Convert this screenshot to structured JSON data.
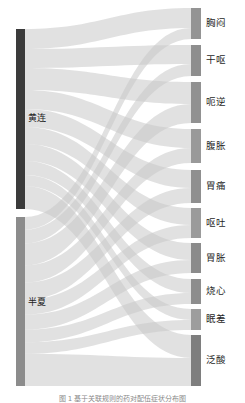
{
  "figure": {
    "caption": "图 1  基于关联规则的药对配伍症状分布图",
    "background": "#ffffff"
  },
  "chart_data": {
    "type": "sankey",
    "title": "",
    "xlabel": "",
    "ylabel": "",
    "orientation": "horizontal",
    "link_color": "#c9c9c9",
    "link_opacity": 0.55,
    "nodes": [
      {
        "id": "huanglian",
        "label": "黄连",
        "side": "left",
        "color": "#3b3b3b",
        "x": 16,
        "y": 29,
        "width": 9,
        "height": 180,
        "value": 180
      },
      {
        "id": "banxia",
        "label": "半夏",
        "side": "left",
        "color": "#8c8c8c",
        "x": 16,
        "y": 217,
        "width": 9,
        "height": 169,
        "value": 169
      },
      {
        "id": "xiongmen",
        "label": "胸闷",
        "side": "right",
        "color": "#949494",
        "x": 191,
        "y": 8,
        "width": 10,
        "height": 31,
        "value": 31
      },
      {
        "id": "gan_ou",
        "label": "干呕",
        "side": "right",
        "color": "#8e8e8e",
        "x": 191,
        "y": 45,
        "width": 10,
        "height": 31,
        "value": 31
      },
      {
        "id": "e_ni",
        "label": "呃逆",
        "side": "right",
        "color": "#919191",
        "x": 191,
        "y": 82,
        "width": 10,
        "height": 41,
        "value": 41
      },
      {
        "id": "fuzhang",
        "label": "腹胀",
        "side": "right",
        "color": "#999999",
        "x": 191,
        "y": 129,
        "width": 10,
        "height": 34,
        "value": 34
      },
      {
        "id": "weitong",
        "label": "胃痛",
        "side": "right",
        "color": "#8f8f8f",
        "x": 191,
        "y": 170,
        "width": 10,
        "height": 33,
        "value": 33
      },
      {
        "id": "outu",
        "label": "呕吐",
        "side": "right",
        "color": "#9b9b9b",
        "x": 191,
        "y": 208,
        "width": 10,
        "height": 30,
        "value": 30
      },
      {
        "id": "weizhang",
        "label": "胃胀",
        "side": "right",
        "color": "#8b8b8b",
        "x": 191,
        "y": 243,
        "width": 10,
        "height": 30,
        "value": 30
      },
      {
        "id": "shaoxin",
        "label": "烧心",
        "side": "right",
        "color": "#8d8d8d",
        "x": 191,
        "y": 279,
        "width": 10,
        "height": 25,
        "value": 25
      },
      {
        "id": "mianchai",
        "label": "眠差",
        "side": "right",
        "color": "#9d9d9d",
        "x": 191,
        "y": 309,
        "width": 10,
        "height": 21,
        "value": 21
      },
      {
        "id": "fansuan",
        "label": "泛酸",
        "side": "right",
        "color": "#7e7e7e",
        "x": 191,
        "y": 335,
        "width": 10,
        "height": 51,
        "value": 51
      }
    ],
    "links": [
      {
        "source": "huanglian",
        "target": "xiongmen",
        "value": 20
      },
      {
        "source": "huanglian",
        "target": "gan_ou",
        "value": 19
      },
      {
        "source": "huanglian",
        "target": "e_ni",
        "value": 22
      },
      {
        "source": "huanglian",
        "target": "fuzhang",
        "value": 19
      },
      {
        "source": "huanglian",
        "target": "weitong",
        "value": 18
      },
      {
        "source": "huanglian",
        "target": "outu",
        "value": 17
      },
      {
        "source": "huanglian",
        "target": "weizhang",
        "value": 17
      },
      {
        "source": "huanglian",
        "target": "shaoxin",
        "value": 14
      },
      {
        "source": "huanglian",
        "target": "mianchai",
        "value": 11
      },
      {
        "source": "huanglian",
        "target": "fansuan",
        "value": 23
      },
      {
        "source": "banxia",
        "target": "xiongmen",
        "value": 11
      },
      {
        "source": "banxia",
        "target": "gan_ou",
        "value": 12
      },
      {
        "source": "banxia",
        "target": "e_ni",
        "value": 19
      },
      {
        "source": "banxia",
        "target": "fuzhang",
        "value": 15
      },
      {
        "source": "banxia",
        "target": "weitong",
        "value": 15
      },
      {
        "source": "banxia",
        "target": "outu",
        "value": 13
      },
      {
        "source": "banxia",
        "target": "weizhang",
        "value": 13
      },
      {
        "source": "banxia",
        "target": "shaoxin",
        "value": 11
      },
      {
        "source": "banxia",
        "target": "mianchai",
        "value": 10
      },
      {
        "source": "banxia",
        "target": "fansuan",
        "value": 28
      }
    ]
  },
  "labels": {
    "sources": [
      {
        "text": "黄连",
        "x": 28,
        "y": 114
      },
      {
        "text": "半夏",
        "x": 28,
        "y": 298
      }
    ],
    "targets": [
      {
        "text": "胸闷",
        "x": 206,
        "y": 18
      },
      {
        "text": "干呕",
        "x": 206,
        "y": 55
      },
      {
        "text": "呃逆",
        "x": 206,
        "y": 97
      },
      {
        "text": "腹胀",
        "x": 206,
        "y": 141
      },
      {
        "text": "胃痛",
        "x": 206,
        "y": 181
      },
      {
        "text": "呕吐",
        "x": 206,
        "y": 218
      },
      {
        "text": "胃胀",
        "x": 206,
        "y": 253
      },
      {
        "text": "烧心",
        "x": 206,
        "y": 286
      },
      {
        "text": "眠差",
        "x": 206,
        "y": 314
      },
      {
        "text": "泛酸",
        "x": 206,
        "y": 355
      }
    ]
  }
}
